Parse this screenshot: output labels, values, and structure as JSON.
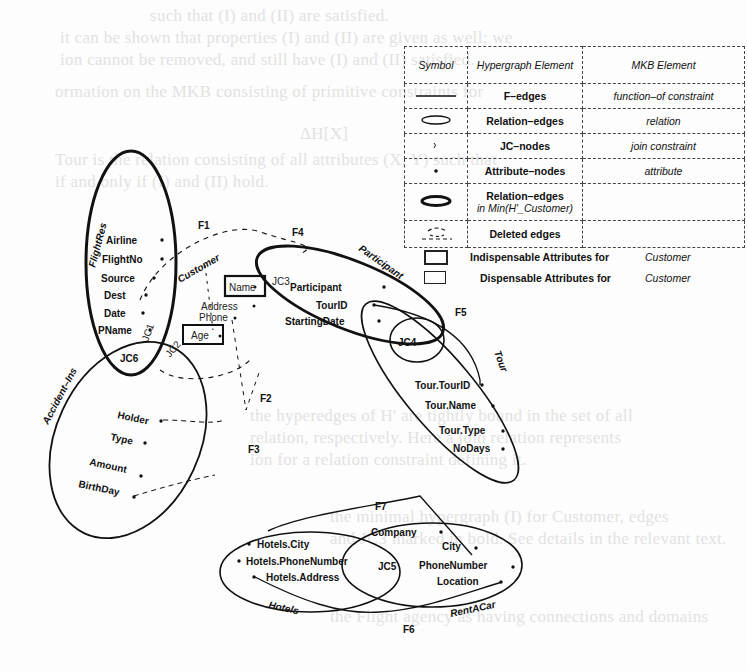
{
  "background_text": [
    "such that (I) and (II) are satisfied.",
    "it can be shown that properties (I) and (II) are given as well; we",
    "ion cannot be removed, and still have (I) and (II) satisfied.",
    "ormation on the MKB consisting of primitive constraints for",
    "ΔH[X]",
    "Tour is the relation consisting of all attributes (X, Y) such that",
    "if and only if (I) and (II) hold.",
    "the hyperedges of H' are tightly bound in the set of all",
    "relation, respectively. Here a join relation represents",
    "ion for a relation constraint defining it.",
    "the minimal hypergraph (I) for Customer, edges",
    "and JC3 marked in bold. See details in the relevant text.",
    "the Flight agency as having connections and domains"
  ],
  "legend": {
    "headers": [
      "Symbol",
      "Hypergraph Element",
      "MKB Element"
    ],
    "rows": [
      {
        "symbol": "solid-line",
        "hypergraph": "F–edges",
        "mkb": "function–of constraint"
      },
      {
        "symbol": "thin-ellipse",
        "hypergraph": "Relation–edges",
        "mkb": "relation"
      },
      {
        "symbol": "jc-mark",
        "hypergraph": "JC–nodes",
        "mkb": "join constraint"
      },
      {
        "symbol": "dot",
        "hypergraph": "Attribute–nodes",
        "mkb": "attribute"
      },
      {
        "symbol": "bold-ellipse",
        "hypergraph": "Relation–edges",
        "hypergraph_sub": "in Min(H'_Customer)",
        "mkb": ""
      },
      {
        "symbol": "dashed-ellipse",
        "hypergraph": "Deleted edges",
        "mkb": ""
      }
    ],
    "extra": [
      {
        "swatch": "bold-box",
        "label": "Indispensable Attributes for",
        "target": "Customer"
      },
      {
        "swatch": "thin-box",
        "label": "Dispensable Attributes for",
        "target": "Customer"
      }
    ]
  },
  "diagram": {
    "relations": {
      "flightres": {
        "name": "FlightRes",
        "attributes": [
          "Airline",
          "FlightNo",
          "Source",
          "Dest",
          "Date",
          "PName"
        ]
      },
      "customer": {
        "name": "Customer",
        "attributes": [
          "Name",
          "Address",
          "Phone",
          "Age"
        ]
      },
      "participant": {
        "name": "Participant",
        "attributes": [
          "Participant",
          "TourID",
          "StartingDate"
        ]
      },
      "tour": {
        "name": "Tour",
        "attributes": [
          "Tour.TourID",
          "Tour.Name",
          "Tour.Type",
          "NoDays"
        ]
      },
      "accident": {
        "name": "Accident–Ins",
        "attributes": [
          "Holder",
          "Type",
          "Amount",
          "BirthDay"
        ]
      },
      "hotels": {
        "name": "Hotels",
        "attributes": [
          "Hotels.City",
          "Hotels.PhoneNumber",
          "Hotels.Address"
        ]
      },
      "rentacar": {
        "name": "RentACar",
        "attributes": [
          "Company",
          "City",
          "PhoneNumber",
          "Location"
        ]
      }
    },
    "jc_nodes": [
      "JC1",
      "JC2",
      "JC3",
      "JC4",
      "JC5",
      "JC6"
    ],
    "f_edges": [
      "F1",
      "F2",
      "F3",
      "F4",
      "F5",
      "F6",
      "F7"
    ]
  }
}
